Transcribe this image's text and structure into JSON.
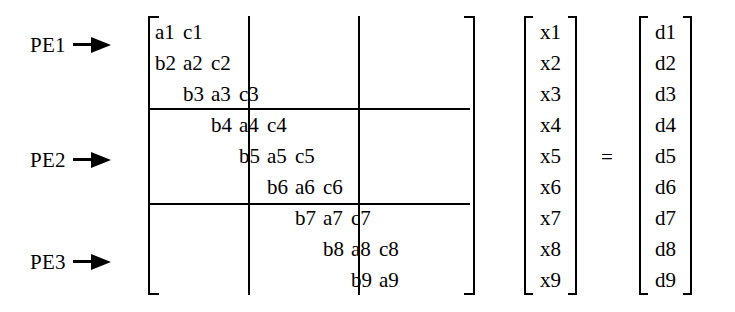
{
  "figure": {
    "kind": "tridiagonal-matrix-equation",
    "equals_symbol": "="
  },
  "pe_labels": [
    {
      "name": "PE1",
      "text": "PE1"
    },
    {
      "name": "PE2",
      "text": "PE2"
    },
    {
      "name": "PE3",
      "text": "PE3"
    }
  ],
  "matrix": {
    "rows": [
      {
        "index": 1,
        "offset": 0,
        "cells": [
          "a1",
          "c1"
        ]
      },
      {
        "index": 2,
        "offset": 0,
        "cells": [
          "b2",
          "a2",
          "c2"
        ]
      },
      {
        "index": 3,
        "offset": 28,
        "cells": [
          "b3",
          "a3",
          "c3"
        ]
      },
      {
        "index": 4,
        "offset": 56,
        "cells": [
          "b4",
          "a4",
          "c4"
        ]
      },
      {
        "index": 5,
        "offset": 84,
        "cells": [
          "b5",
          "a5",
          "c5"
        ]
      },
      {
        "index": 6,
        "offset": 112,
        "cells": [
          "b6",
          "a6",
          "c6"
        ]
      },
      {
        "index": 7,
        "offset": 140,
        "cells": [
          "b7",
          "a7",
          "c7"
        ]
      },
      {
        "index": 8,
        "offset": 168,
        "cells": [
          "b8",
          "a8",
          "c8"
        ]
      },
      {
        "index": 9,
        "offset": 196,
        "cells": [
          "b9",
          "a9"
        ]
      }
    ]
  },
  "vector_x": {
    "label": "x",
    "entries": [
      "x1",
      "x2",
      "x3",
      "x4",
      "x5",
      "x6",
      "x7",
      "x8",
      "x9"
    ]
  },
  "vector_d": {
    "label": "d",
    "entries": [
      "d1",
      "d2",
      "d3",
      "d4",
      "d5",
      "d6",
      "d7",
      "d8",
      "d9"
    ]
  }
}
